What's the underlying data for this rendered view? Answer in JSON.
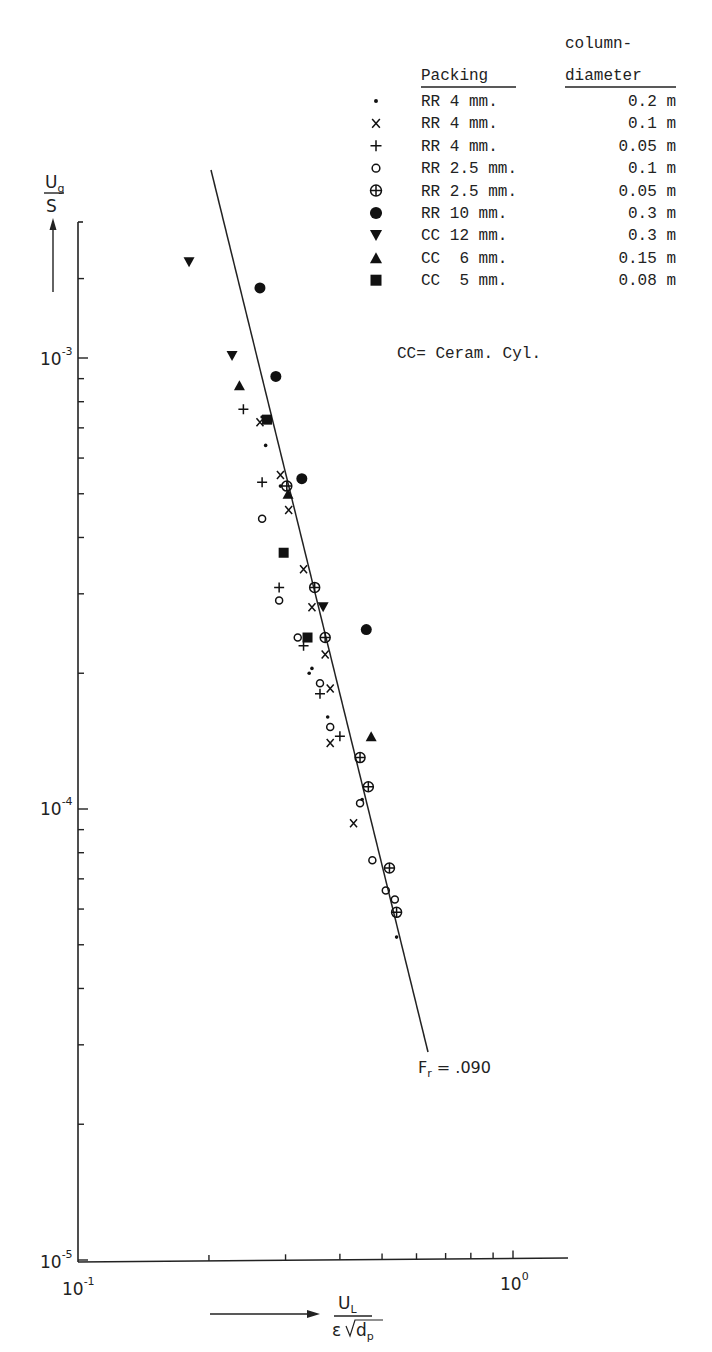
{
  "chart_data": {
    "type": "scatter",
    "title": "",
    "xlabel": {
      "numerator": "U",
      "numerator_sub": "L",
      "denominator_eps": "ε",
      "denominator_root": "d",
      "denominator_sub": "p"
    },
    "ylabel": {
      "numerator": "U",
      "numerator_sub": "g",
      "denominator": "S"
    },
    "xscale": "log",
    "yscale": "log",
    "xlim": [
      0.1,
      1.3
    ],
    "ylim": [
      1e-05,
      0.0019
    ],
    "grid": false,
    "x_ticks": [
      {
        "value": 0.1,
        "base": "10",
        "exp": "-1"
      },
      {
        "value": 1.0,
        "base": "10",
        "exp": "0"
      }
    ],
    "y_ticks": [
      {
        "value": 0.001,
        "base": "10",
        "exp": "-3"
      },
      {
        "value": 0.0001,
        "base": "10",
        "exp": "-4"
      },
      {
        "value": 1e-05,
        "base": "10",
        "exp": "-5"
      }
    ],
    "fit_line": {
      "label": "Fr = .090",
      "label_prefix": "F",
      "label_sub": "r",
      "label_value": " = .090",
      "points": [
        [
          0.2027,
          0.00208
        ],
        [
          0.5957,
          2.27e-05
        ]
      ]
    },
    "legend": {
      "header_packing": "Packing",
      "header_diameter_line1": "column-",
      "header_diameter_line2": "diameter",
      "note": "CC= Ceram. Cyl.",
      "position": "upper right"
    },
    "series": [
      {
        "name": "RR 4 mm.",
        "packing": "RR 4 mm.",
        "diameter": "0.2 m",
        "marker": "dot",
        "points": [
          [
            0.265,
            0.00074
          ],
          [
            0.27,
            0.00064
          ],
          [
            0.292,
            0.00052
          ],
          [
            0.34,
            0.0002
          ],
          [
            0.375,
            0.00016
          ],
          [
            0.45,
            0.000105
          ],
          [
            0.54,
            5.2e-05
          ],
          [
            0.345,
            0.000205
          ]
        ]
      },
      {
        "name": "RR 4 mm. (0.1 m)",
        "packing": "RR 4 mm.",
        "diameter": "0.1 m",
        "marker": "x",
        "points": [
          [
            0.262,
            0.00072
          ],
          [
            0.292,
            0.00055
          ],
          [
            0.305,
            0.00046
          ],
          [
            0.33,
            0.00034
          ],
          [
            0.345,
            0.00028
          ],
          [
            0.37,
            0.00022
          ],
          [
            0.38,
            0.000185
          ],
          [
            0.38,
            0.00014
          ],
          [
            0.43,
            9.3e-05
          ]
        ]
      },
      {
        "name": "RR 4 mm. (0.05 m)",
        "packing": "RR 4 mm.",
        "diameter": "0.05 m",
        "marker": "plus",
        "points": [
          [
            0.24,
            0.00077
          ],
          [
            0.265,
            0.00053
          ],
          [
            0.29,
            0.00031
          ],
          [
            0.33,
            0.00023
          ],
          [
            0.36,
            0.00018
          ],
          [
            0.4,
            0.000145
          ]
        ]
      },
      {
        "name": "RR 2.5 mm.",
        "packing": "RR 2.5 mm.",
        "diameter": "0.1 m",
        "marker": "circle",
        "points": [
          [
            0.265,
            0.00044
          ],
          [
            0.29,
            0.00029
          ],
          [
            0.32,
            0.00024
          ],
          [
            0.36,
            0.00019
          ],
          [
            0.38,
            0.000152
          ],
          [
            0.445,
            0.000103
          ],
          [
            0.475,
            7.7e-05
          ],
          [
            0.51,
            6.6e-05
          ],
          [
            0.535,
            6.3e-05
          ]
        ]
      },
      {
        "name": "RR 2.5 mm. (0.05 m)",
        "packing": "RR 2.5 mm.",
        "diameter": "0.05 m",
        "marker": "circle-plus",
        "points": [
          [
            0.302,
            0.00052
          ],
          [
            0.35,
            0.00031
          ],
          [
            0.37,
            0.00024
          ],
          [
            0.445,
            0.00013
          ],
          [
            0.465,
            0.000112
          ],
          [
            0.52,
            7.4e-05
          ],
          [
            0.54,
            5.9e-05
          ]
        ]
      },
      {
        "name": "RR 10 mm.",
        "packing": "RR 10 mm.",
        "diameter": "0.3 m",
        "marker": "filled-circle",
        "points": [
          [
            0.262,
            0.00143
          ],
          [
            0.285,
            0.00091
          ],
          [
            0.327,
            0.00054
          ],
          [
            0.46,
            0.00025
          ]
        ]
      },
      {
        "name": "CC 12 mm.",
        "packing": "CC 12 mm.",
        "diameter": "0.3 m",
        "marker": "filled-triangle-down",
        "points": [
          [
            0.18,
            0.00163
          ],
          [
            0.226,
            0.00101
          ],
          [
            0.366,
            0.00028
          ]
        ]
      },
      {
        "name": "CC 6 mm.",
        "packing": "CC 6 mm.",
        "diameter": "0.15 m",
        "marker": "filled-triangle-up",
        "points": [
          [
            0.235,
            0.00087
          ],
          [
            0.304,
            0.0005
          ],
          [
            0.472,
            0.000145
          ]
        ]
      },
      {
        "name": "CC 5 mm.",
        "packing": "CC 5 mm.",
        "diameter": "0.08 m",
        "marker": "filled-square",
        "points": [
          [
            0.272,
            0.00073
          ],
          [
            0.297,
            0.00037
          ],
          [
            0.337,
            0.00024
          ]
        ]
      }
    ]
  },
  "legend_rows": [
    {
      "symbol": "dot",
      "packing": "RR 4 mm.",
      "diameter": "0.2 m"
    },
    {
      "symbol": "x",
      "packing": "RR 4 mm.",
      "diameter": "0.1 m"
    },
    {
      "symbol": "plus",
      "packing": "RR 4 mm.",
      "diameter": "0.05 m"
    },
    {
      "symbol": "circle",
      "packing": "RR 2.5 mm.",
      "diameter": "0.1 m"
    },
    {
      "symbol": "circle-plus",
      "packing": "RR 2.5 mm.",
      "diameter": "0.05 m"
    },
    {
      "symbol": "filled-circle",
      "packing": "RR 10 mm.",
      "diameter": "0.3 m"
    },
    {
      "symbol": "filled-triangle-down",
      "packing": "CC 12 mm.",
      "diameter": "0.3 m"
    },
    {
      "symbol": "filled-triangle-up",
      "packing": "CC  6 mm.",
      "diameter": "0.15 m"
    },
    {
      "symbol": "filled-square",
      "packing": "CC  5 mm.",
      "diameter": "0.08 m"
    }
  ]
}
